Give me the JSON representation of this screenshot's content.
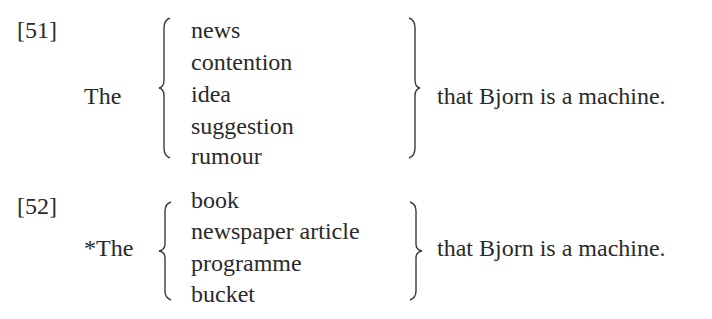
{
  "examples": [
    {
      "number": "[51]",
      "determiner": "The",
      "nouns": [
        "news",
        "contention",
        "idea",
        "suggestion",
        "rumour"
      ],
      "complement": "that Bjorn is a machine."
    },
    {
      "number": "[52]",
      "determiner": "*The",
      "nouns": [
        "book",
        "newspaper article",
        "programme",
        "bucket"
      ],
      "complement": "that Bjorn is a machine."
    }
  ]
}
